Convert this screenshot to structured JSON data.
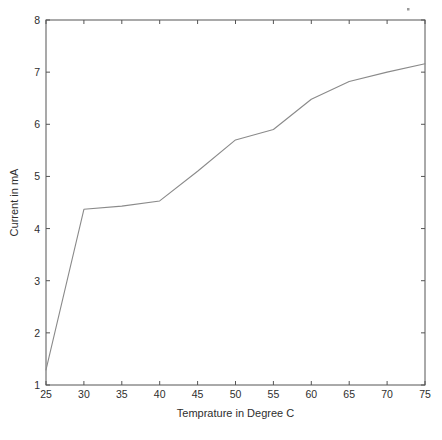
{
  "figure": {
    "background_color": "#ffffff",
    "axis_color": "#555555",
    "line_color": "#8a8a8a",
    "text_color": "#2e2e2e",
    "title": ""
  },
  "chart_data": {
    "type": "line",
    "title": "",
    "xlabel": "Temprature in Degree C",
    "ylabel": "Current in mA",
    "xlim": [
      25,
      75
    ],
    "ylim": [
      1,
      8
    ],
    "xticks": [
      25,
      30,
      35,
      40,
      45,
      50,
      55,
      60,
      65,
      70,
      75
    ],
    "xticklabels": [
      "25",
      "30",
      "35",
      "40",
      "45",
      "50",
      "55",
      "60",
      "65",
      "70",
      "75"
    ],
    "yticks": [
      1,
      2,
      3,
      4,
      5,
      6,
      7,
      8
    ],
    "yticklabels": [
      "1",
      "2",
      "3",
      "4",
      "5",
      "6",
      "7",
      "8"
    ],
    "grid": false,
    "legend": null,
    "x": [
      25,
      30,
      35,
      40,
      45,
      50,
      55,
      60,
      65,
      70,
      75
    ],
    "values": [
      1.29,
      4.37,
      4.43,
      4.53,
      5.1,
      5.7,
      5.9,
      6.48,
      6.82,
      7.0,
      7.16
    ],
    "series": [
      {
        "name": "Current",
        "color": "#8a8a8a",
        "x": [
          25,
          30,
          35,
          40,
          45,
          50,
          55,
          60,
          65,
          70,
          75
        ],
        "values": [
          1.29,
          4.37,
          4.43,
          4.53,
          5.1,
          5.7,
          5.9,
          6.48,
          6.82,
          7.0,
          7.16
        ]
      }
    ],
    "annotations": []
  }
}
